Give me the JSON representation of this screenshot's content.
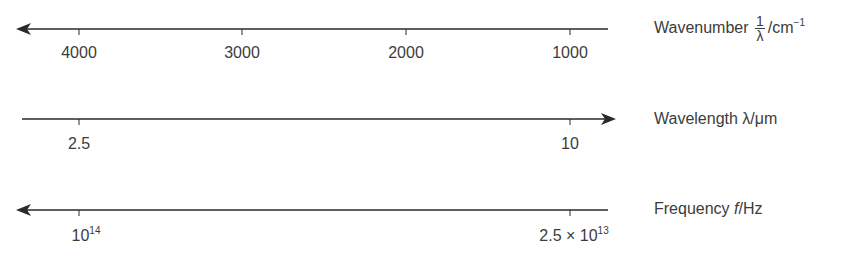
{
  "colors": {
    "line": "#2a2a2a",
    "text": "#3c3c3c",
    "background": "#ffffff"
  },
  "axes": [
    {
      "name": "wavenumber",
      "direction": "left",
      "label": {
        "text": "Wavenumber",
        "fraction_num": "1",
        "fraction_den": "λ",
        "unit": "/cm",
        "unit_sup": "−1"
      },
      "ticks": [
        {
          "label": "4000"
        },
        {
          "label": "3000"
        },
        {
          "label": "2000"
        },
        {
          "label": "1000"
        }
      ]
    },
    {
      "name": "wavelength",
      "direction": "right",
      "label": {
        "text": "Wavelength",
        "symbol": "λ",
        "unit": "/μm"
      },
      "ticks": [
        {
          "label": "2.5"
        },
        {
          "label": "10"
        }
      ]
    },
    {
      "name": "frequency",
      "direction": "left",
      "label": {
        "text": "Frequency",
        "symbol": "f",
        "unit": "/Hz"
      },
      "ticks": [
        {
          "label_base": "10",
          "label_sup": "14"
        },
        {
          "label_base": "2.5 × 10",
          "label_sup": "13"
        }
      ]
    }
  ]
}
